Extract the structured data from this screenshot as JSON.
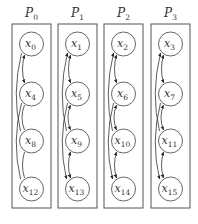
{
  "diagram": {
    "processes": [
      {
        "label": "P",
        "sub": "0",
        "nodes": [
          {
            "v": "x",
            "s": "0"
          },
          {
            "v": "x",
            "s": "4"
          },
          {
            "v": "x",
            "s": "8"
          },
          {
            "v": "x",
            "s": "12"
          }
        ]
      },
      {
        "label": "P",
        "sub": "1",
        "nodes": [
          {
            "v": "x",
            "s": "1"
          },
          {
            "v": "x",
            "s": "5"
          },
          {
            "v": "x",
            "s": "9"
          },
          {
            "v": "x",
            "s": "13"
          }
        ]
      },
      {
        "label": "P",
        "sub": "2",
        "nodes": [
          {
            "v": "x",
            "s": "2"
          },
          {
            "v": "x",
            "s": "6"
          },
          {
            "v": "x",
            "s": "10"
          },
          {
            "v": "x",
            "s": "14"
          }
        ]
      },
      {
        "label": "P",
        "sub": "3",
        "nodes": [
          {
            "v": "x",
            "s": "3"
          },
          {
            "v": "x",
            "s": "7"
          },
          {
            "v": "x",
            "s": "11"
          },
          {
            "v": "x",
            "s": "15"
          }
        ]
      }
    ],
    "edges_per_process": [
      "x0<->x4",
      "x0-x8 (curved)",
      "x4-x12 (curved)",
      "x4<->x8",
      "x8<->x12"
    ]
  }
}
